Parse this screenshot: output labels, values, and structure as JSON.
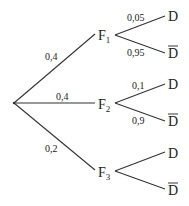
{
  "diagram": {
    "type": "probability-tree",
    "root": {
      "x": 14,
      "y": 103
    },
    "level1": [
      {
        "id": "F1",
        "name": "F",
        "sub": "1",
        "prob": "0,4",
        "end": {
          "x": 95,
          "y": 34
        },
        "label_pos": {
          "x": 45,
          "y": 60
        },
        "node_pos": {
          "x": 98,
          "y": 40
        }
      },
      {
        "id": "F2",
        "name": "F",
        "sub": "2",
        "prob": "0,4",
        "end": {
          "x": 95,
          "y": 103
        },
        "label_pos": {
          "x": 56,
          "y": 100
        },
        "node_pos": {
          "x": 98,
          "y": 109
        }
      },
      {
        "id": "F3",
        "name": "F",
        "sub": "3",
        "prob": "0,2",
        "end": {
          "x": 95,
          "y": 170
        },
        "label_pos": {
          "x": 45,
          "y": 152
        },
        "node_pos": {
          "x": 98,
          "y": 177
        }
      }
    ],
    "level2": [
      {
        "parent": "F1",
        "outcome": "D",
        "bar": false,
        "prob": "0,05",
        "start": {
          "x": 115,
          "y": 35
        },
        "end": {
          "x": 165,
          "y": 16
        },
        "label_pos": {
          "x": 127,
          "y": 21
        },
        "node_pos": {
          "x": 168,
          "y": 21
        }
      },
      {
        "parent": "F1",
        "outcome": "D",
        "bar": true,
        "prob": "0,95",
        "start": {
          "x": 115,
          "y": 35
        },
        "end": {
          "x": 165,
          "y": 53
        },
        "label_pos": {
          "x": 127,
          "y": 56
        },
        "node_pos": {
          "x": 168,
          "y": 58
        }
      },
      {
        "parent": "F2",
        "outcome": "D",
        "bar": false,
        "prob": "0,1",
        "start": {
          "x": 115,
          "y": 103
        },
        "end": {
          "x": 165,
          "y": 84
        },
        "label_pos": {
          "x": 132,
          "y": 89
        },
        "node_pos": {
          "x": 168,
          "y": 89
        }
      },
      {
        "parent": "F2",
        "outcome": "D",
        "bar": true,
        "prob": "0,9",
        "start": {
          "x": 115,
          "y": 103
        },
        "end": {
          "x": 165,
          "y": 121
        },
        "label_pos": {
          "x": 132,
          "y": 124
        },
        "node_pos": {
          "x": 168,
          "y": 126
        }
      },
      {
        "parent": "F3",
        "outcome": "D",
        "bar": false,
        "prob": "",
        "start": {
          "x": 115,
          "y": 171
        },
        "end": {
          "x": 165,
          "y": 152
        },
        "label_pos": {
          "x": 0,
          "y": 0
        },
        "node_pos": {
          "x": 168,
          "y": 158
        }
      },
      {
        "parent": "F3",
        "outcome": "D",
        "bar": true,
        "prob": "",
        "start": {
          "x": 115,
          "y": 171
        },
        "end": {
          "x": 165,
          "y": 189
        },
        "label_pos": {
          "x": 0,
          "y": 0
        },
        "node_pos": {
          "x": 168,
          "y": 195
        }
      }
    ]
  }
}
